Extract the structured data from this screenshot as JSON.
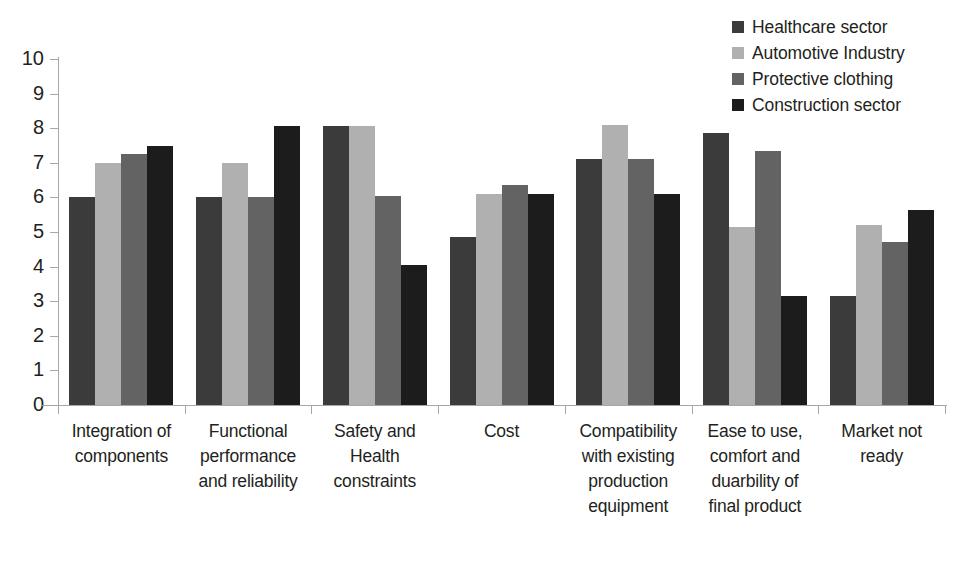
{
  "chart_data": {
    "type": "bar",
    "title": "",
    "xlabel": "",
    "ylabel": "",
    "ylim": [
      0,
      10
    ],
    "yticks": [
      0,
      1,
      2,
      3,
      4,
      5,
      6,
      7,
      8,
      9,
      10
    ],
    "ytick_labels": [
      "0",
      "1",
      "2",
      "3",
      "4",
      "5",
      "6",
      "7",
      "8",
      "9",
      "10"
    ],
    "grid": false,
    "legend_position": "top-right",
    "categories": [
      "Integration of components",
      "Functional performance and reliability",
      "Safety and Health constraints",
      "Cost",
      "Compatibility with existing production equipment",
      "Ease to use, comfort and duarbility of final product",
      "Market not ready"
    ],
    "category_lines": [
      [
        "Integration of",
        "components"
      ],
      [
        "Functional",
        "performance",
        "and reliability"
      ],
      [
        "Safety and",
        "Health",
        "constraints"
      ],
      [
        "Cost"
      ],
      [
        "Compatibility",
        "with existing",
        "production",
        "equipment"
      ],
      [
        "Ease to use,",
        "comfort and",
        "duarbility of",
        "final product"
      ],
      [
        "Market not",
        "ready"
      ]
    ],
    "series": [
      {
        "name": "Healthcare sector",
        "color": "#3b3b3b",
        "values": [
          6.0,
          6.0,
          8.05,
          4.85,
          7.1,
          7.85,
          3.15
        ]
      },
      {
        "name": "Automotive Industry",
        "color": "#b0b0b0",
        "values": [
          7.0,
          7.0,
          8.05,
          6.1,
          8.1,
          5.15,
          5.2
        ]
      },
      {
        "name": "Protective clothing",
        "color": "#636363",
        "values": [
          7.25,
          6.0,
          6.05,
          6.35,
          7.1,
          7.35,
          4.7
        ]
      },
      {
        "name": "Construction sector",
        "color": "#1c1c1c",
        "values": [
          7.5,
          8.05,
          4.05,
          6.1,
          6.1,
          3.15,
          5.65
        ]
      }
    ]
  },
  "legend": {
    "items": [
      {
        "label": "Healthcare sector",
        "color": "#3b3b3b"
      },
      {
        "label": "Automotive Industry",
        "color": "#b0b0b0"
      },
      {
        "label": "Protective clothing",
        "color": "#636363"
      },
      {
        "label": "Construction sector",
        "color": "#1c1c1c"
      }
    ]
  },
  "axes": {
    "y_axis_color": "#a6a6a6",
    "x_axis_color": "#a6a6a6"
  }
}
